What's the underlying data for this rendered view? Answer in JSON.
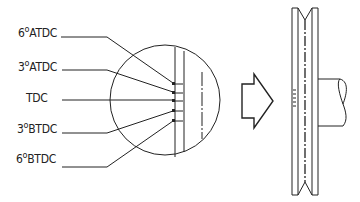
{
  "diagram": {
    "labels": [
      {
        "id": "6-atdc",
        "number": "6",
        "degree": "o",
        "suffix": "ATDC"
      },
      {
        "id": "3-atdc",
        "number": "3",
        "degree": "o",
        "suffix": "ATDC"
      },
      {
        "id": "tdc",
        "number": "",
        "degree": "",
        "suffix": "TDC"
      },
      {
        "id": "3-btdc",
        "number": "3",
        "degree": "o",
        "suffix": "BTDC"
      },
      {
        "id": "6-btdc",
        "number": "6",
        "degree": "o",
        "suffix": "BTDC"
      }
    ],
    "components": {
      "detail_view": "magnified-circle",
      "arrow": "right-pointing-outline-arrow",
      "pulley": "crankshaft-pulley-side-view"
    },
    "colors": {
      "ink": "#222222",
      "background": "#ffffff"
    }
  }
}
